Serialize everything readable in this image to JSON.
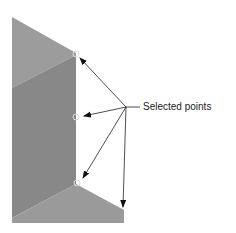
{
  "annotation": {
    "label": "Selected points",
    "label_anchor": [
      126,
      107
    ],
    "arrow_targets": [
      [
        78,
        56
      ],
      [
        83,
        116
      ],
      [
        82,
        180
      ],
      [
        123,
        207
      ]
    ]
  },
  "shape": {
    "faces": [
      {
        "name": "top-face",
        "color": "#9c9c9c"
      },
      {
        "name": "middle-face",
        "color": "#888888"
      },
      {
        "name": "bottom-face",
        "color": "#9a9a9a"
      }
    ],
    "selected_points": [
      [
        76,
        54
      ],
      [
        76,
        117
      ],
      [
        76,
        183
      ]
    ]
  }
}
